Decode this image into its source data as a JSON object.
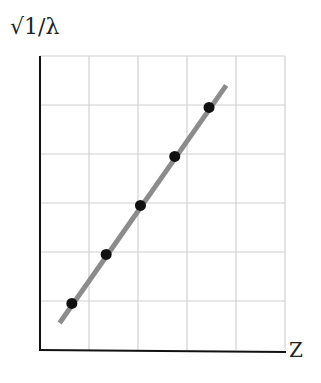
{
  "chart_data": {
    "type": "line",
    "title": "",
    "xlabel": "Z",
    "ylabel": "√1/λ",
    "grid": true,
    "x": [
      0.65,
      1.35,
      2.05,
      2.75,
      3.45
    ],
    "series": [
      {
        "name": "data points",
        "values": [
          0.95,
          1.95,
          2.95,
          3.95,
          4.95
        ]
      }
    ],
    "fit_line": {
      "x": [
        0.4,
        3.8
      ],
      "y": [
        0.55,
        5.4
      ]
    },
    "xlim": [
      0,
      5
    ],
    "ylim": [
      0,
      6
    ],
    "tick_labels_shown": false
  },
  "labels": {
    "y": "√1/λ",
    "x": "Z"
  }
}
